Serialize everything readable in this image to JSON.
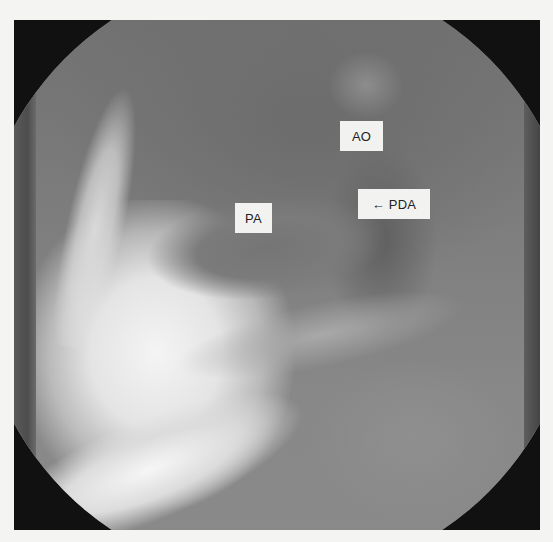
{
  "image": {
    "type": "angiography-xray",
    "description": "Lateral angiogram showing pulmonary artery, aorta, and patent ductus arteriosus",
    "background_color": "#f4f4f2",
    "label_background": "#f2f2f0",
    "label_text_color": "#222222"
  },
  "labels": {
    "ao": "AO",
    "pda": "← PDA",
    "pa": "PA"
  }
}
